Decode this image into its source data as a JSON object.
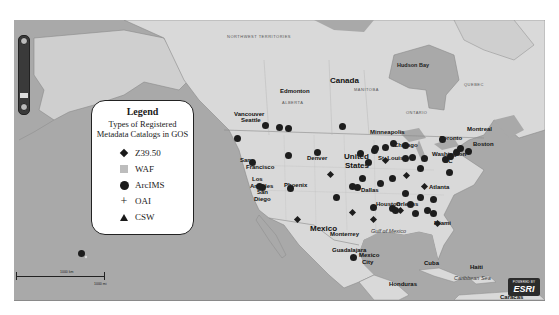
{
  "legend": {
    "title": "Legend",
    "subtitle_line1": "Types of Registered",
    "subtitle_line2": "Metadata Catalogs in GOS",
    "items": [
      {
        "symbol": "diamond",
        "label": "Z39.50"
      },
      {
        "symbol": "square",
        "label": "WAF"
      },
      {
        "symbol": "circle",
        "label": "ArcIMS"
      },
      {
        "symbol": "plus",
        "label": "OAI"
      },
      {
        "symbol": "triangle",
        "label": "CSW"
      }
    ]
  },
  "map": {
    "labels": {
      "canada": "Canada",
      "hudson_bay": "Hudson Bay",
      "edmonton": "Edmonton",
      "vancouver": "Vancouver",
      "seattle": "Seattle",
      "minneapolis": "Minneapolis",
      "toronto": "Toronto",
      "montreal": "Montreal",
      "boston": "Boston",
      "chicago": "Chicago",
      "washington": "Washington",
      "dc": "DC",
      "st_louis": "St. Louis",
      "denver": "Denver",
      "united_states_1": "United",
      "united_states_2": "States",
      "san_francisco_1": "San",
      "san_francisco_2": "Francisco",
      "los_angeles_1": "Los",
      "los_angeles_2": "Angeles",
      "san_diego_1": "San",
      "san_diego_2": "Diego",
      "phoenix": "Phoenix",
      "dallas": "Dallas",
      "houston": "Houston",
      "new_orleans": "Orleans",
      "atlanta": "Atlanta",
      "miami": "Miami",
      "mexico": "Mexico",
      "monterrey": "Monterrey",
      "guadalajara": "Guadalajara",
      "mexico_city_1": "Mexico",
      "mexico_city_2": "City",
      "gulf_of_mexico": "Gulf of Mexico",
      "cuba": "Cuba",
      "haiti": "Haiti",
      "caribbean_sea": "Caribbean Sea",
      "honduras": "Honduras",
      "caracas": "Caracas",
      "northwest_territories": "NORTHWEST TERRITORIES",
      "alberta": "ALBERTA",
      "manitoba": "MANITOBA",
      "ontario": "ONTARIO",
      "quebec": "QUEBEC"
    },
    "scale": {
      "km_label": "1000 km",
      "mi_label": "1000 mi"
    },
    "attribution": {
      "powered_by": "POWERED BY",
      "logo": "ESRI"
    },
    "colors": {
      "water": "#a9a9a9",
      "land": "#d9d9d9",
      "marker": "#1d1d1d"
    },
    "markers": [
      {
        "type": "circle",
        "x": 237,
        "y": 138
      },
      {
        "type": "circle",
        "x": 265,
        "y": 125
      },
      {
        "type": "circle",
        "x": 279,
        "y": 127
      },
      {
        "type": "circle",
        "x": 288,
        "y": 128
      },
      {
        "type": "circle",
        "x": 342,
        "y": 126
      },
      {
        "type": "circle",
        "x": 288,
        "y": 155
      },
      {
        "type": "circle",
        "x": 317,
        "y": 152
      },
      {
        "type": "circle",
        "x": 252,
        "y": 162
      },
      {
        "type": "circle",
        "x": 262,
        "y": 187
      },
      {
        "type": "circle",
        "x": 259,
        "y": 186
      },
      {
        "type": "circle",
        "x": 290,
        "y": 188
      },
      {
        "type": "circle",
        "x": 336,
        "y": 197
      },
      {
        "type": "circle",
        "x": 360,
        "y": 153
      },
      {
        "type": "circle",
        "x": 368,
        "y": 162
      },
      {
        "type": "circle",
        "x": 374,
        "y": 150
      },
      {
        "type": "circle",
        "x": 375,
        "y": 148
      },
      {
        "type": "circle",
        "x": 385,
        "y": 147
      },
      {
        "type": "circle",
        "x": 393,
        "y": 143
      },
      {
        "type": "circle",
        "x": 405,
        "y": 145
      },
      {
        "type": "circle",
        "x": 405,
        "y": 158
      },
      {
        "type": "circle",
        "x": 412,
        "y": 157
      },
      {
        "type": "circle",
        "x": 424,
        "y": 158
      },
      {
        "type": "circle",
        "x": 420,
        "y": 168
      },
      {
        "type": "circle",
        "x": 445,
        "y": 159
      },
      {
        "type": "circle",
        "x": 450,
        "y": 156
      },
      {
        "type": "circle",
        "x": 456,
        "y": 152
      },
      {
        "type": "circle",
        "x": 460,
        "y": 148
      },
      {
        "type": "circle",
        "x": 468,
        "y": 151
      },
      {
        "type": "circle",
        "x": 442,
        "y": 139
      },
      {
        "type": "circle",
        "x": 449,
        "y": 172
      },
      {
        "type": "circle",
        "x": 380,
        "y": 183
      },
      {
        "type": "circle",
        "x": 392,
        "y": 178
      },
      {
        "type": "circle",
        "x": 357,
        "y": 187
      },
      {
        "type": "circle",
        "x": 362,
        "y": 178
      },
      {
        "type": "circle",
        "x": 352,
        "y": 186
      },
      {
        "type": "circle",
        "x": 405,
        "y": 193
      },
      {
        "type": "circle",
        "x": 410,
        "y": 204
      },
      {
        "type": "circle",
        "x": 420,
        "y": 197
      },
      {
        "type": "circle",
        "x": 433,
        "y": 199
      },
      {
        "type": "circle",
        "x": 415,
        "y": 213
      },
      {
        "type": "circle",
        "x": 427,
        "y": 210
      },
      {
        "type": "circle",
        "x": 433,
        "y": 213
      },
      {
        "type": "circle",
        "x": 373,
        "y": 207
      },
      {
        "type": "circle",
        "x": 392,
        "y": 208
      },
      {
        "type": "circle",
        "x": 395,
        "y": 210
      },
      {
        "type": "circle",
        "x": 81,
        "y": 253
      },
      {
        "type": "circle",
        "x": 353,
        "y": 257
      },
      {
        "type": "diamond",
        "x": 330,
        "y": 174
      },
      {
        "type": "diamond",
        "x": 385,
        "y": 160
      },
      {
        "type": "diamond",
        "x": 400,
        "y": 210
      },
      {
        "type": "diamond",
        "x": 352,
        "y": 212
      },
      {
        "type": "diamond",
        "x": 424,
        "y": 186
      },
      {
        "type": "diamond",
        "x": 437,
        "y": 223
      },
      {
        "type": "diamond",
        "x": 406,
        "y": 175
      },
      {
        "type": "diamond",
        "x": 373,
        "y": 219
      },
      {
        "type": "diamond",
        "x": 297,
        "y": 219
      }
    ]
  }
}
